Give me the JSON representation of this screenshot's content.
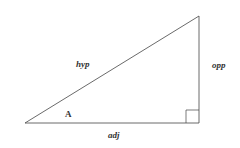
{
  "diagram": {
    "type": "right-triangle",
    "labels": {
      "hypotenuse": "hyp",
      "opposite": "opp",
      "adjacent": "adj",
      "angle": "A"
    },
    "colors": {
      "line": "#333333",
      "background": "#ffffff"
    }
  }
}
